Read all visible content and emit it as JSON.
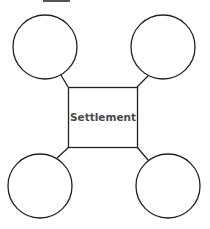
{
  "diagram": {
    "type": "spider-map",
    "center": {
      "label": "Settlement"
    },
    "branches": [
      {
        "position": "top-left",
        "label": ""
      },
      {
        "position": "top-right",
        "label": ""
      },
      {
        "position": "bottom-left",
        "label": ""
      },
      {
        "position": "bottom-right",
        "label": ""
      }
    ]
  },
  "colors": {
    "stroke": "#222222",
    "text": "#4a4a4a",
    "background": "#ffffff",
    "top_bar": "#555555"
  }
}
